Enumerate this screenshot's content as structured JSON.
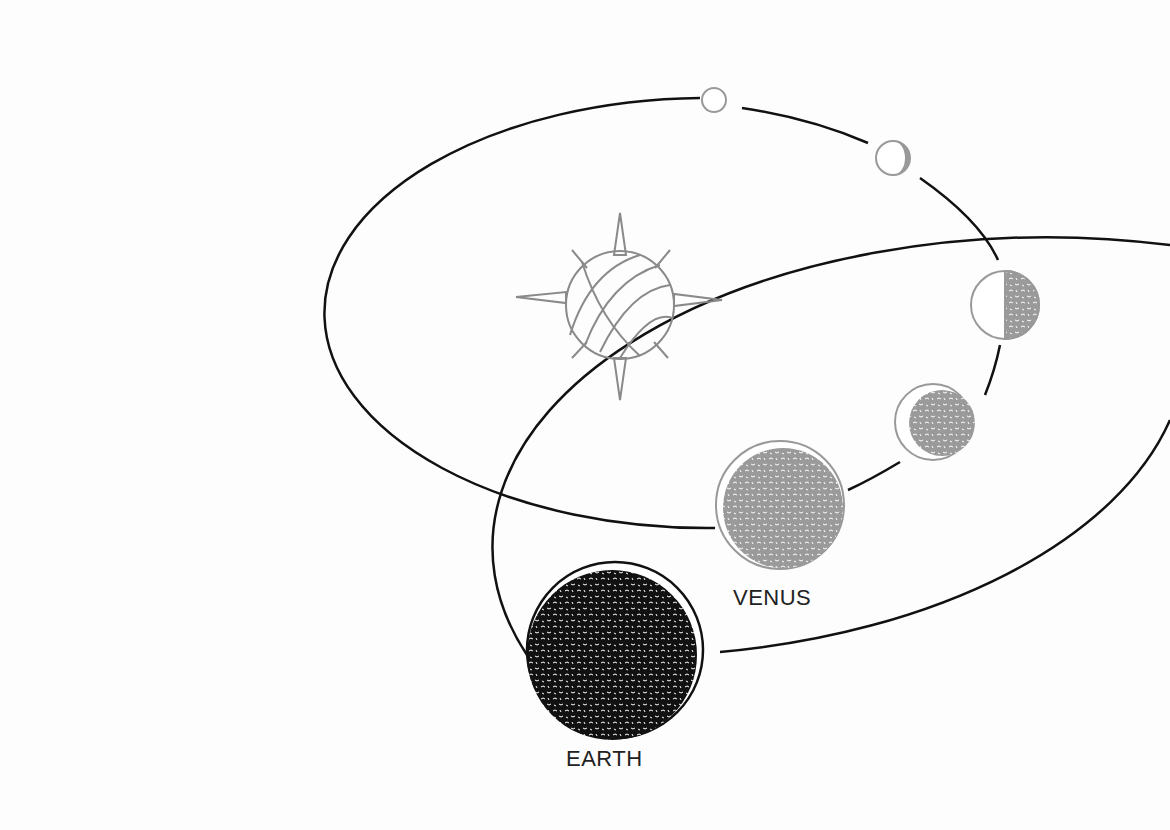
{
  "diagram": {
    "labels": {
      "venus": "VENUS",
      "earth": "EARTH"
    },
    "colors": {
      "background": "#fdfdfd",
      "orbit": "#111111",
      "sun": "#8a8a8a",
      "venus_fill": "#9a9a9a",
      "earth_fill": "#111111"
    },
    "sun": {
      "cx": 620,
      "cy": 305,
      "r": 55,
      "icon": "sun-icon"
    },
    "orbits": {
      "venus": {
        "cx": 620,
        "cy": 310,
        "rx": 383,
        "ry": 215
      },
      "earth": {
        "cx": 615,
        "cy": 335,
        "rx": 555,
        "ry": 310
      }
    },
    "venus_phases": [
      {
        "name": "full",
        "cx": 714,
        "cy": 100,
        "r": 13
      },
      {
        "name": "gibbous-thin-crescent-dark",
        "cx": 893,
        "cy": 158,
        "r": 17
      },
      {
        "name": "half",
        "cx": 1005,
        "cy": 305,
        "r": 34
      },
      {
        "name": "crescent-large",
        "cx": 933,
        "cy": 422,
        "r": 38
      },
      {
        "name": "nearly-new",
        "cx": 780,
        "cy": 505,
        "r": 64
      }
    ],
    "earth": {
      "cx": 615,
      "cy": 650,
      "r": 88
    }
  }
}
